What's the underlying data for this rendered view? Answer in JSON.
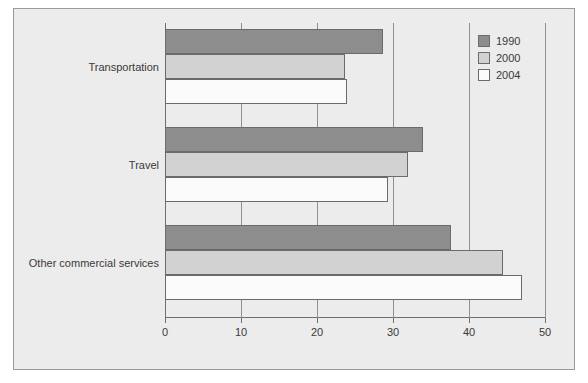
{
  "chart_data": {
    "type": "bar",
    "orientation": "horizontal",
    "title": "",
    "xlabel": "",
    "ylabel": "",
    "xlim": [
      0,
      50
    ],
    "xticks": [
      0,
      10,
      20,
      30,
      40,
      50
    ],
    "xtick_labels": [
      "0",
      "10",
      "20",
      "30",
      "40",
      "50"
    ],
    "grid": true,
    "grid_axis": "x",
    "legend_position": "top-right",
    "categories": [
      "Transportation",
      "Travel",
      "Other commercial services"
    ],
    "series": [
      {
        "name": "1990",
        "color": "#8d8d8d",
        "values": [
          28.7,
          34.0,
          37.6
        ]
      },
      {
        "name": "2000",
        "color": "#d2d2d2",
        "values": [
          23.7,
          32.0,
          44.5
        ]
      },
      {
        "name": "2004",
        "color": "#fbfbfb",
        "values": [
          24.0,
          29.3,
          47.0
        ]
      }
    ]
  },
  "legend": {
    "entries": [
      {
        "label": "1990",
        "swatch": "legend-swatch-1990"
      },
      {
        "label": "2000",
        "swatch": "legend-swatch-2000"
      },
      {
        "label": "2004",
        "swatch": "legend-swatch-2004"
      }
    ]
  },
  "colors": {
    "background": "#ececec",
    "frame_border": "#9a9a9a",
    "axis": "#6f6f6f",
    "gridline": "#8f8f8f",
    "bar_edge": "#6b6b6b",
    "text": "#3a3a3a",
    "series_1990": "#8d8d8d",
    "series_2000": "#d2d2d2",
    "series_2004": "#fbfbfb"
  }
}
